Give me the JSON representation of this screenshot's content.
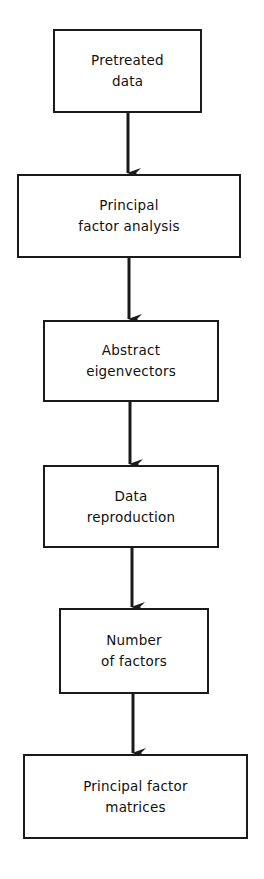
{
  "diagram": {
    "type": "flowchart",
    "direction": "top-to-bottom",
    "colors": {
      "stroke": "#1a1a1a",
      "text": "#111111",
      "background": "#ffffff"
    },
    "nodes": [
      {
        "id": "pretreated-data",
        "lines": [
          "Pretreated",
          "data"
        ]
      },
      {
        "id": "principal-factor-analysis",
        "lines": [
          "Principal",
          "factor analysis"
        ]
      },
      {
        "id": "abstract-eigenvectors",
        "lines": [
          "Abstract",
          "eigenvectors"
        ]
      },
      {
        "id": "data-reproduction",
        "lines": [
          "Data",
          "reproduction"
        ]
      },
      {
        "id": "number-of-factors",
        "lines": [
          "Number",
          "of factors"
        ]
      },
      {
        "id": "principal-factor-matrices",
        "lines": [
          "Principal factor",
          "matrices"
        ]
      }
    ],
    "edges": [
      {
        "from": "pretreated-data",
        "to": "principal-factor-analysis"
      },
      {
        "from": "principal-factor-analysis",
        "to": "abstract-eigenvectors"
      },
      {
        "from": "abstract-eigenvectors",
        "to": "data-reproduction"
      },
      {
        "from": "data-reproduction",
        "to": "number-of-factors"
      },
      {
        "from": "number-of-factors",
        "to": "principal-factor-matrices"
      }
    ]
  }
}
